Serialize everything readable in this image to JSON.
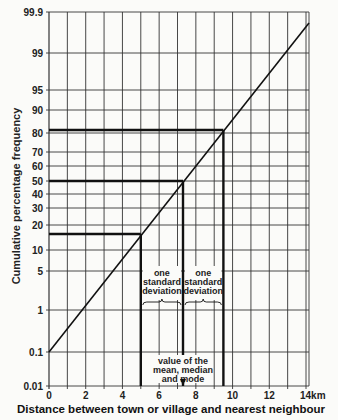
{
  "chart_data": {
    "type": "line",
    "title": "",
    "xlabel": "Distance between town or village and nearest neighbour",
    "ylabel": "Cumulative percentage frequency",
    "x_unit": "km",
    "xlim": [
      0,
      14
    ],
    "x_ticks": [
      "0",
      "2",
      "4",
      "6",
      "8",
      "10",
      "12",
      "14km"
    ],
    "y_scale": "probability",
    "y_ticks": [
      "0.01",
      "0.1",
      "1",
      "5",
      "10",
      "20",
      "30",
      "40",
      "50",
      "60",
      "70",
      "80",
      "90",
      "95",
      "99",
      "99.9"
    ],
    "grid": true,
    "series": [
      {
        "name": "cumulative distribution",
        "points": [
          {
            "x": 0,
            "y": 0.1
          },
          {
            "x": 2,
            "y": 1
          },
          {
            "x": 5,
            "y": 16
          },
          {
            "x": 7.3,
            "y": 50
          },
          {
            "x": 9.5,
            "y": 84
          },
          {
            "x": 14,
            "y": 99.7
          }
        ]
      }
    ],
    "reference_lines": [
      {
        "x": 5,
        "y": 16
      },
      {
        "x": 7.3,
        "y": 50
      },
      {
        "x": 9.5,
        "y": 84
      }
    ],
    "annotations": {
      "sd_left": [
        "one",
        "standard",
        "deviation"
      ],
      "sd_right": [
        "one",
        "standard",
        "deviation"
      ],
      "mean": [
        "value of the",
        "mean, median",
        "and  mode"
      ]
    }
  }
}
